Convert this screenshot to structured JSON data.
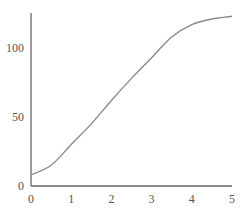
{
  "chart_data": {
    "type": "line",
    "title": "",
    "xlabel": "",
    "ylabel": "",
    "xlim": [
      0,
      5
    ],
    "ylim": [
      0,
      125
    ],
    "grid": false,
    "legend": null,
    "x_ticks": [
      "0",
      "1",
      "2",
      "3",
      "4",
      "5"
    ],
    "y_ticks": [
      "0",
      "50",
      "100"
    ],
    "series": [
      {
        "name": "curve",
        "color": "#8a8a8a",
        "x": [
          0,
          0.5,
          1,
          1.5,
          2,
          2.5,
          3,
          3.5,
          4,
          4.5,
          5
        ],
        "y": [
          8,
          15,
          30,
          45,
          62,
          78,
          93,
          108,
          117,
          121,
          123
        ]
      }
    ]
  },
  "axis_color": "#555555"
}
